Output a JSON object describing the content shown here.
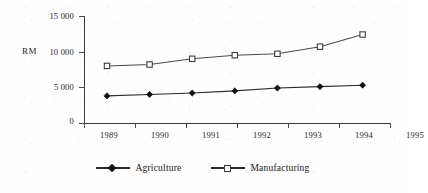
{
  "chart_data": {
    "type": "line",
    "title": "",
    "subtitle": "",
    "xlabel": "",
    "ylabel": "RM",
    "categories": [
      "1989",
      "1990",
      "1991",
      "1992",
      "1993",
      "1994",
      "1995"
    ],
    "x": [
      1989,
      1990,
      1991,
      1992,
      1993,
      1994,
      1995
    ],
    "ylim": [
      0,
      15000
    ],
    "yticks": [
      0,
      5000,
      10000,
      15000
    ],
    "ytick_labels": [
      "0",
      "5 000",
      "10 000",
      "15 000"
    ],
    "grid": false,
    "legend_position": "bottom",
    "series": [
      {
        "name": "Agriculture",
        "marker": "filled-diamond",
        "color": "#1a1a1a",
        "values": [
          3800,
          4000,
          4200,
          4500,
          4900,
          5100,
          5300
        ]
      },
      {
        "name": "Manufacturing",
        "marker": "open-square",
        "color": "#3c3c3c",
        "values": [
          8000,
          8200,
          9000,
          9500,
          9700,
          10700,
          12400
        ]
      }
    ]
  },
  "axis": {
    "y_title": "RM",
    "y_tick_labels": [
      "15 000",
      "10 000",
      "5 000",
      "0"
    ],
    "x_tick_labels": [
      "1989",
      "1990",
      "1991",
      "1992",
      "1993",
      "1994",
      "1995"
    ]
  },
  "legend": {
    "items": [
      {
        "label": "Agriculture",
        "marker": "filled-diamond-icon"
      },
      {
        "label": "Manufacturing",
        "marker": "open-square-icon"
      }
    ]
  }
}
